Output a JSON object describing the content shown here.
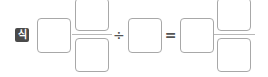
{
  "label": "식",
  "expression": {
    "whole_1": "",
    "fraction_1": {
      "numerator": "",
      "denominator": ""
    },
    "operator": "÷",
    "operand_2": "",
    "equals": "=",
    "whole_result": "",
    "fraction_result": {
      "numerator": "",
      "denominator": ""
    }
  },
  "colors": {
    "badge": "#4a4a4a",
    "box_border": "#a8a8a8",
    "bar": "#b8b8b8"
  }
}
